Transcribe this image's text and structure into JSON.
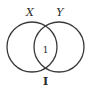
{
  "diagram": {
    "type": "venn",
    "sets": [
      {
        "label": "X"
      },
      {
        "label": "Y"
      }
    ],
    "intersection_value": "1",
    "universe_label": "I",
    "stroke_color": "#3a3a3a",
    "background": "#ffffff"
  }
}
